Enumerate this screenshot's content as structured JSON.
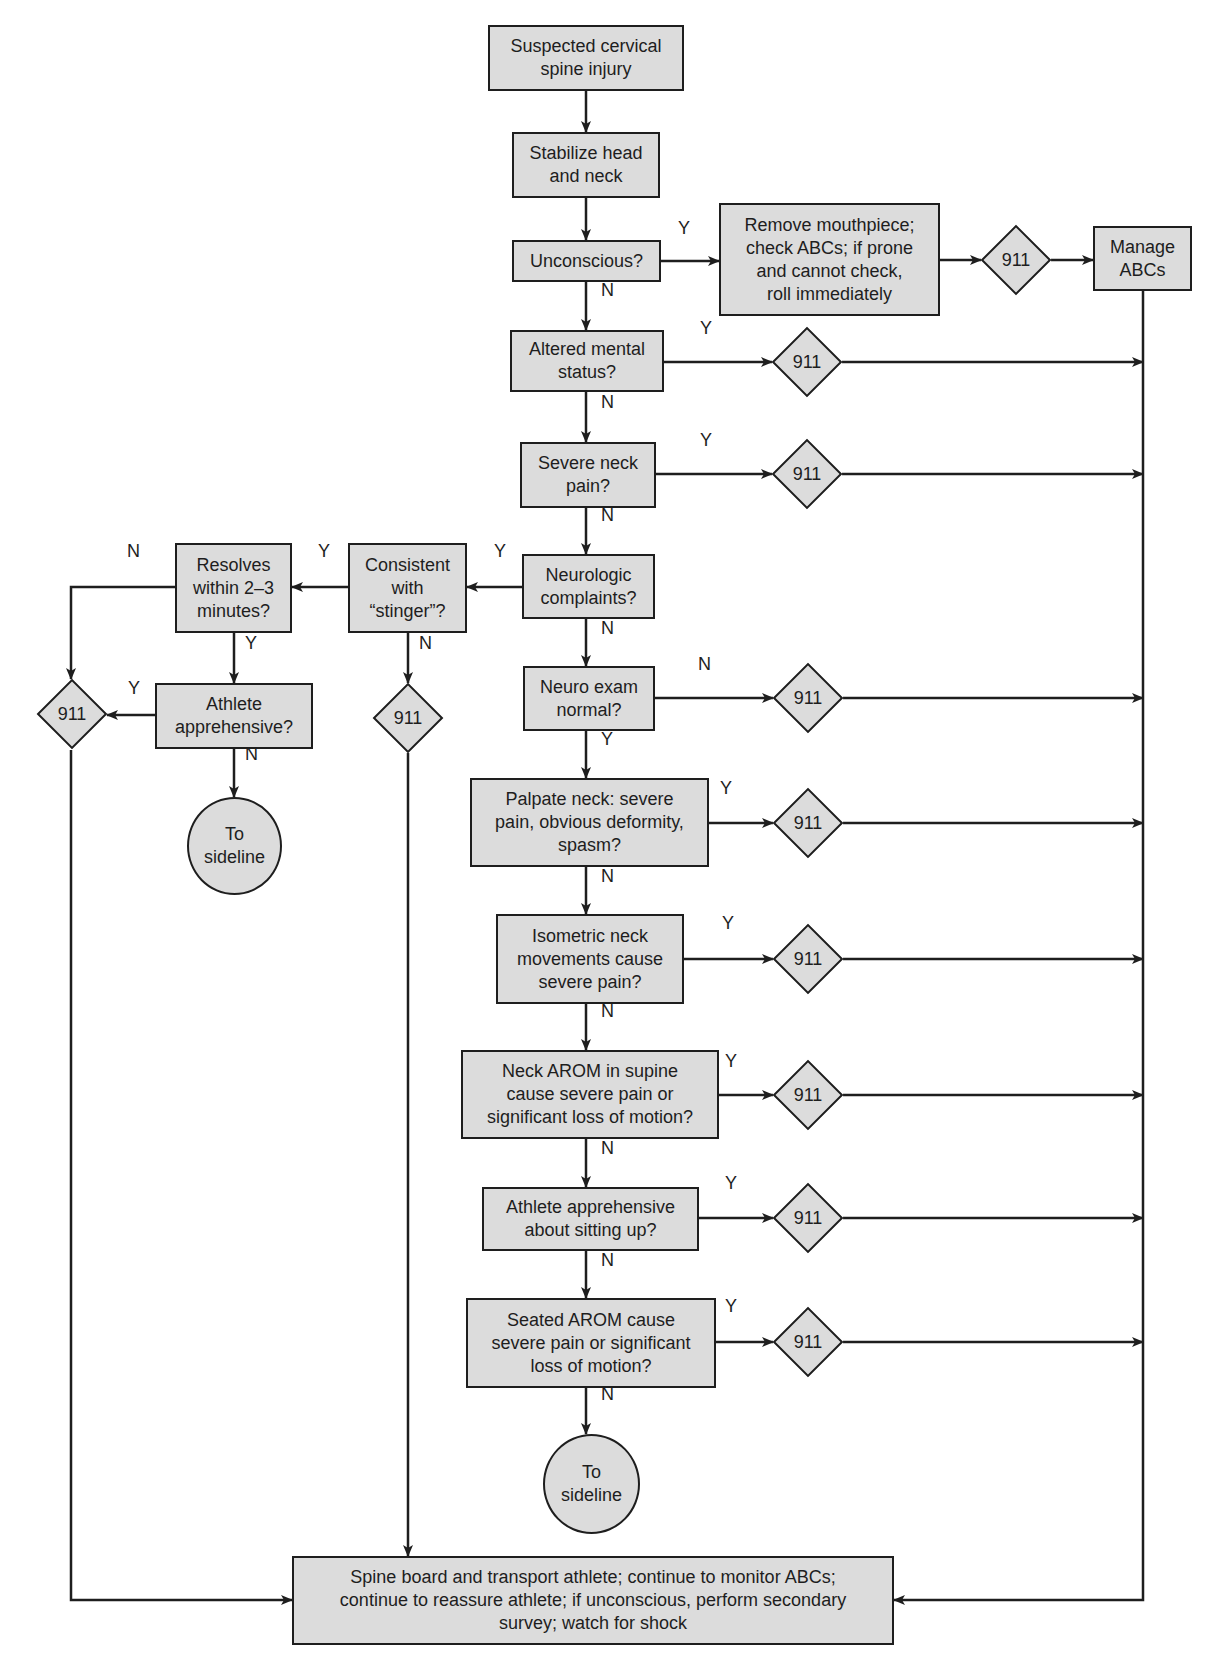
{
  "diagram": {
    "colors": {
      "fill": "#dcdcdc",
      "stroke": "#1e1e1e",
      "background": "#ffffff"
    },
    "nodes": [
      {
        "id": "start",
        "shape": "rect",
        "text": "Suspected cervical\nspine injury",
        "x": 488,
        "y": 25,
        "w": 196,
        "h": 66
      },
      {
        "id": "stabilize",
        "shape": "rect",
        "text": "Stabilize head\nand neck",
        "x": 512,
        "y": 132,
        "w": 148,
        "h": 66
      },
      {
        "id": "unconscious",
        "shape": "rect",
        "text": "Unconscious?",
        "x": 512,
        "y": 240,
        "w": 149,
        "h": 42
      },
      {
        "id": "remove",
        "shape": "rect",
        "text": "Remove mouthpiece;\ncheck ABCs; if prone\nand cannot check,\nroll immediately",
        "x": 719,
        "y": 203,
        "w": 221,
        "h": 113
      },
      {
        "id": "manage",
        "shape": "rect",
        "text": "Manage\nABCs",
        "x": 1093,
        "y": 226,
        "w": 99,
        "h": 65
      },
      {
        "id": "altered",
        "shape": "rect",
        "text": "Altered mental\nstatus?",
        "x": 510,
        "y": 330,
        "w": 154,
        "h": 62
      },
      {
        "id": "severe",
        "shape": "rect",
        "text": "Severe neck\npain?",
        "x": 520,
        "y": 442,
        "w": 136,
        "h": 66
      },
      {
        "id": "neurologic",
        "shape": "rect",
        "text": "Neurologic\ncomplaints?",
        "x": 522,
        "y": 554,
        "w": 133,
        "h": 65
      },
      {
        "id": "stinger",
        "shape": "rect",
        "text": "Consistent\nwith\n“stinger”?",
        "x": 348,
        "y": 543,
        "w": 119,
        "h": 90
      },
      {
        "id": "resolves",
        "shape": "rect",
        "text": "Resolves\nwithin 2–3\nminutes?",
        "x": 175,
        "y": 543,
        "w": 117,
        "h": 90
      },
      {
        "id": "athlete_app",
        "shape": "rect",
        "text": "Athlete\napprehensive?",
        "x": 155,
        "y": 683,
        "w": 158,
        "h": 66
      },
      {
        "id": "sideline1",
        "shape": "circle",
        "text": "To\nsideline",
        "x": 187,
        "y": 797,
        "w": 95,
        "h": 98
      },
      {
        "id": "neuro_exam",
        "shape": "rect",
        "text": "Neuro exam\nnormal?",
        "x": 523,
        "y": 666,
        "w": 132,
        "h": 65
      },
      {
        "id": "palpate",
        "shape": "rect",
        "text": "Palpate neck: severe\npain, obvious deformity,\nspasm?",
        "x": 470,
        "y": 778,
        "w": 239,
        "h": 89
      },
      {
        "id": "isometric",
        "shape": "rect",
        "text": "Isometric neck\nmovements cause\nsevere pain?",
        "x": 496,
        "y": 914,
        "w": 188,
        "h": 90
      },
      {
        "id": "arom_supine",
        "shape": "rect",
        "text": "Neck AROM in supine\ncause severe pain or\nsignificant loss of motion?",
        "x": 461,
        "y": 1050,
        "w": 258,
        "h": 89
      },
      {
        "id": "sitting_up",
        "shape": "rect",
        "text": "Athlete apprehensive\nabout sitting up?",
        "x": 482,
        "y": 1187,
        "w": 217,
        "h": 64
      },
      {
        "id": "seated_arom",
        "shape": "rect",
        "text": "Seated AROM cause\nsevere pain or significant\nloss of motion?",
        "x": 466,
        "y": 1298,
        "w": 250,
        "h": 90
      },
      {
        "id": "sideline2",
        "shape": "circle",
        "text": "To\nsideline",
        "x": 543,
        "y": 1434,
        "w": 97,
        "h": 100
      },
      {
        "id": "spineboard",
        "shape": "rect",
        "text": "Spine board and transport athlete; continue to monitor ABCs;\ncontinue to reassure athlete; if unconscious, perform secondary\nsurvey; watch for shock",
        "x": 292,
        "y": 1556,
        "w": 602,
        "h": 89
      }
    ],
    "diamonds": [
      {
        "id": "d_remove",
        "label": "911",
        "cx": 1016,
        "cy": 260
      },
      {
        "id": "d_altered",
        "label": "911",
        "cx": 807,
        "cy": 362
      },
      {
        "id": "d_severe",
        "label": "911",
        "cx": 807,
        "cy": 474
      },
      {
        "id": "d_neuro",
        "label": "911",
        "cx": 808,
        "cy": 698
      },
      {
        "id": "d_palpate",
        "label": "911",
        "cx": 808,
        "cy": 823
      },
      {
        "id": "d_isometric",
        "label": "911",
        "cx": 808,
        "cy": 959
      },
      {
        "id": "d_supine",
        "label": "911",
        "cx": 808,
        "cy": 1095
      },
      {
        "id": "d_sitting",
        "label": "911",
        "cx": 808,
        "cy": 1218
      },
      {
        "id": "d_seated",
        "label": "911",
        "cx": 808,
        "cy": 1342
      },
      {
        "id": "d_left",
        "label": "911",
        "cx": 72,
        "cy": 714
      },
      {
        "id": "d_stinger",
        "label": "911",
        "cx": 408,
        "cy": 718
      }
    ],
    "edges": [
      {
        "pts": [
          [
            586,
            91
          ],
          [
            586,
            132
          ]
        ],
        "arrow": true
      },
      {
        "pts": [
          [
            586,
            198
          ],
          [
            586,
            240
          ]
        ],
        "arrow": true
      },
      {
        "pts": [
          [
            586,
            282
          ],
          [
            586,
            330
          ]
        ],
        "arrow": true
      },
      {
        "pts": [
          [
            661,
            261
          ],
          [
            719,
            261
          ]
        ],
        "arrow": true
      },
      {
        "pts": [
          [
            940,
            260
          ],
          [
            981,
            260
          ]
        ],
        "arrow": true
      },
      {
        "pts": [
          [
            1051,
            260
          ],
          [
            1093,
            260
          ]
        ],
        "arrow": true
      },
      {
        "pts": [
          [
            1143,
            291
          ],
          [
            1143,
            1600
          ],
          [
            894,
            1600
          ]
        ],
        "arrow": true
      },
      {
        "pts": [
          [
            586,
            392
          ],
          [
            586,
            442
          ]
        ],
        "arrow": true
      },
      {
        "pts": [
          [
            664,
            362
          ],
          [
            772,
            362
          ]
        ],
        "arrow": true
      },
      {
        "pts": [
          [
            842,
            362
          ],
          [
            1143,
            362
          ]
        ],
        "arrow": true
      },
      {
        "pts": [
          [
            586,
            508
          ],
          [
            586,
            554
          ]
        ],
        "arrow": true
      },
      {
        "pts": [
          [
            656,
            474
          ],
          [
            772,
            474
          ]
        ],
        "arrow": true
      },
      {
        "pts": [
          [
            842,
            474
          ],
          [
            1143,
            474
          ]
        ],
        "arrow": true
      },
      {
        "pts": [
          [
            586,
            619
          ],
          [
            586,
            666
          ]
        ],
        "arrow": true
      },
      {
        "pts": [
          [
            522,
            587
          ],
          [
            467,
            587
          ]
        ],
        "arrow": true
      },
      {
        "pts": [
          [
            348,
            587
          ],
          [
            292,
            587
          ]
        ],
        "arrow": true
      },
      {
        "pts": [
          [
            175,
            587
          ],
          [
            71,
            587
          ],
          [
            71,
            679
          ]
        ],
        "arrow": true
      },
      {
        "pts": [
          [
            234,
            633
          ],
          [
            234,
            683
          ]
        ],
        "arrow": true
      },
      {
        "pts": [
          [
            155,
            715
          ],
          [
            107,
            715
          ]
        ],
        "arrow": true
      },
      {
        "pts": [
          [
            234,
            749
          ],
          [
            234,
            797
          ]
        ],
        "arrow": true
      },
      {
        "pts": [
          [
            408,
            633
          ],
          [
            408,
            683
          ]
        ],
        "arrow": true
      },
      {
        "pts": [
          [
            71,
            750
          ],
          [
            71,
            1600
          ],
          [
            292,
            1600
          ]
        ],
        "arrow": true
      },
      {
        "pts": [
          [
            408,
            753
          ],
          [
            408,
            1556
          ]
        ],
        "arrow": true
      },
      {
        "pts": [
          [
            655,
            698
          ],
          [
            773,
            698
          ]
        ],
        "arrow": true
      },
      {
        "pts": [
          [
            843,
            698
          ],
          [
            1143,
            698
          ]
        ],
        "arrow": true
      },
      {
        "pts": [
          [
            586,
            731
          ],
          [
            586,
            778
          ]
        ],
        "arrow": true
      },
      {
        "pts": [
          [
            709,
            823
          ],
          [
            773,
            823
          ]
        ],
        "arrow": true
      },
      {
        "pts": [
          [
            843,
            823
          ],
          [
            1143,
            823
          ]
        ],
        "arrow": true
      },
      {
        "pts": [
          [
            586,
            867
          ],
          [
            586,
            914
          ]
        ],
        "arrow": true
      },
      {
        "pts": [
          [
            684,
            959
          ],
          [
            773,
            959
          ]
        ],
        "arrow": true
      },
      {
        "pts": [
          [
            843,
            959
          ],
          [
            1143,
            959
          ]
        ],
        "arrow": true
      },
      {
        "pts": [
          [
            586,
            1004
          ],
          [
            586,
            1050
          ]
        ],
        "arrow": true
      },
      {
        "pts": [
          [
            719,
            1095
          ],
          [
            773,
            1095
          ]
        ],
        "arrow": true
      },
      {
        "pts": [
          [
            843,
            1095
          ],
          [
            1143,
            1095
          ]
        ],
        "arrow": true
      },
      {
        "pts": [
          [
            586,
            1139
          ],
          [
            586,
            1187
          ]
        ],
        "arrow": true
      },
      {
        "pts": [
          [
            699,
            1218
          ],
          [
            773,
            1218
          ]
        ],
        "arrow": true
      },
      {
        "pts": [
          [
            843,
            1218
          ],
          [
            1143,
            1218
          ]
        ],
        "arrow": true
      },
      {
        "pts": [
          [
            586,
            1251
          ],
          [
            586,
            1298
          ]
        ],
        "arrow": true
      },
      {
        "pts": [
          [
            716,
            1342
          ],
          [
            773,
            1342
          ]
        ],
        "arrow": true
      },
      {
        "pts": [
          [
            843,
            1342
          ],
          [
            1143,
            1342
          ]
        ],
        "arrow": true
      },
      {
        "pts": [
          [
            586,
            1388
          ],
          [
            586,
            1434
          ]
        ],
        "arrow": true
      }
    ],
    "edge_labels": [
      {
        "text": "Y",
        "x": 678,
        "y": 230
      },
      {
        "text": "N",
        "x": 601,
        "y": 292
      },
      {
        "text": "Y",
        "x": 700,
        "y": 330
      },
      {
        "text": "N",
        "x": 601,
        "y": 404
      },
      {
        "text": "Y",
        "x": 700,
        "y": 442
      },
      {
        "text": "N",
        "x": 601,
        "y": 517
      },
      {
        "text": "Y",
        "x": 494,
        "y": 553
      },
      {
        "text": "Y",
        "x": 318,
        "y": 553
      },
      {
        "text": "N",
        "x": 127,
        "y": 553
      },
      {
        "text": "Y",
        "x": 245,
        "y": 645
      },
      {
        "text": "N",
        "x": 419,
        "y": 645
      },
      {
        "text": "Y",
        "x": 128,
        "y": 690
      },
      {
        "text": "N",
        "x": 245,
        "y": 756
      },
      {
        "text": "N",
        "x": 601,
        "y": 630
      },
      {
        "text": "N",
        "x": 698,
        "y": 666
      },
      {
        "text": "Y",
        "x": 601,
        "y": 741
      },
      {
        "text": "Y",
        "x": 720,
        "y": 790
      },
      {
        "text": "N",
        "x": 601,
        "y": 878
      },
      {
        "text": "Y",
        "x": 722,
        "y": 925
      },
      {
        "text": "N",
        "x": 601,
        "y": 1013
      },
      {
        "text": "Y",
        "x": 725,
        "y": 1063
      },
      {
        "text": "N",
        "x": 601,
        "y": 1150
      },
      {
        "text": "Y",
        "x": 725,
        "y": 1185
      },
      {
        "text": "N",
        "x": 601,
        "y": 1262
      },
      {
        "text": "Y",
        "x": 725,
        "y": 1308
      },
      {
        "text": "N",
        "x": 601,
        "y": 1396
      }
    ]
  }
}
